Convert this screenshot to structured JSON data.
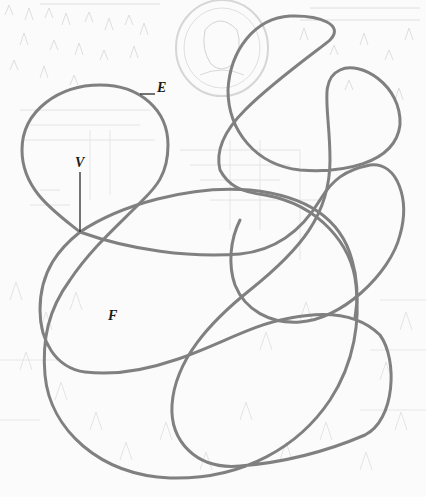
{
  "diagram": {
    "type": "planar closed curve (graph embedding) over faded engraving background",
    "labels": {
      "vertex": "V",
      "edge": "E",
      "face": "F"
    },
    "colors": {
      "curve": "#808080",
      "leader_line": "#1a1a1a",
      "label": "#1a1a1a",
      "background_engraving": "#d8d8d8",
      "background": "#fbfbfb"
    },
    "curve_width_px": 3,
    "annotations": [
      {
        "label": "V",
        "meaning": "vertex (self-intersection point)",
        "x": 80,
        "y": 165,
        "points_to": [
          80,
          232
        ]
      },
      {
        "label": "E",
        "meaning": "edge",
        "x": 157,
        "y": 88,
        "points_to": [
          140,
          94
        ]
      },
      {
        "label": "F",
        "meaning": "face (region)",
        "x": 110,
        "y": 317
      }
    ]
  }
}
